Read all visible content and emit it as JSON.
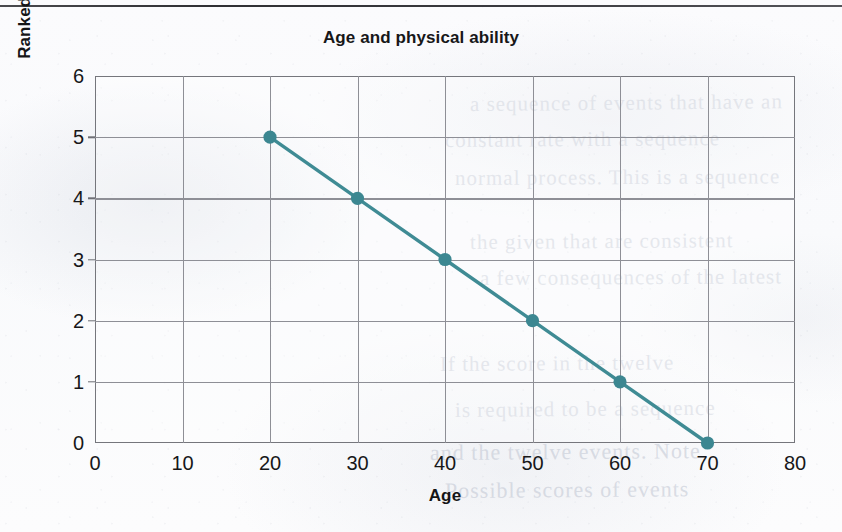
{
  "page": {
    "kind": "scanned-textbook-figure",
    "top_rule": true
  },
  "bleed_through_text": [
    "a sequence of events that have an",
    "constant rate with a sequence",
    "normal process. This is a sequence",
    "the given that are consistent",
    "a few consequences of the latest",
    "If the score in the twelve",
    "is required to be a sequence",
    "and the twelve events. Note",
    "Possible scores of events"
  ],
  "chart_data": {
    "type": "line",
    "title": "Age and physical ability",
    "xlabel": "Age",
    "ylabel": "Ranked score for physicial ability",
    "x": [
      20,
      30,
      40,
      50,
      60,
      70
    ],
    "values": [
      5,
      4,
      3,
      2,
      1,
      0
    ],
    "series": [
      {
        "name": "Ranked score for physicial ability",
        "x": [
          20,
          30,
          40,
          50,
          60,
          70
        ],
        "values": [
          5,
          4,
          3,
          2,
          1,
          0
        ]
      }
    ],
    "xlim": [
      0,
      80
    ],
    "ylim": [
      0,
      6
    ],
    "xticks": [
      0,
      10,
      20,
      30,
      40,
      50,
      60,
      70,
      80
    ],
    "yticks": [
      0,
      1,
      2,
      3,
      4,
      5,
      6
    ],
    "grid": true,
    "legend": false,
    "markers": true,
    "marker_shape": "circle",
    "colors": {
      "line": "#3f8b94",
      "marker": "#3c8791",
      "grid": "#8e8f96",
      "frame": "#75767c",
      "text": "#171719",
      "paper": "#fbfbfd"
    }
  }
}
